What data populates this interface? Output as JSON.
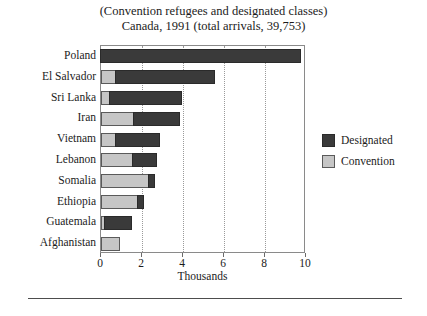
{
  "chart_data": {
    "type": "bar",
    "orientation": "horizontal",
    "stacked": true,
    "title": "(Convention refugees and designated classes)",
    "subtitle": "Canada, 1991 (total arrivals, 39,753)",
    "title_lines": [
      "(Convention refugees and designated classes)",
      "Canada, 1991 (total arrivals, 39,753)"
    ],
    "xlabel": "Thousands",
    "ylabel": "",
    "xlim": [
      0,
      10
    ],
    "ylim": null,
    "grid": "vertical-dotted",
    "legend_position": "right",
    "categories": [
      "Poland",
      "El Salvador",
      "Sri Lanka",
      "Iran",
      "Vietnam",
      "Lebanon",
      "Somalia",
      "Ethiopia",
      "Guatemala",
      "Afghanistan"
    ],
    "xticks": [
      0,
      2,
      4,
      6,
      8,
      10
    ],
    "xtick_labels": [
      "0",
      "2",
      "4",
      "6",
      "8",
      "10"
    ],
    "series": [
      {
        "name": "Convention",
        "color": "#c6c6c6",
        "values": [
          0.0,
          0.75,
          0.45,
          1.6,
          0.75,
          1.55,
          2.35,
          1.8,
          0.2,
          0.95
        ]
      },
      {
        "name": "Designated",
        "color": "#3a3a3a",
        "values": [
          9.8,
          4.85,
          3.55,
          2.3,
          2.2,
          1.25,
          0.35,
          0.35,
          1.35,
          0.0
        ]
      }
    ],
    "totals": [
      9.8,
      5.6,
      4.0,
      3.9,
      2.95,
      2.8,
      2.7,
      2.15,
      1.55,
      0.95
    ]
  },
  "legend": {
    "items": [
      {
        "label": "Designated",
        "swatch": "designated"
      },
      {
        "label": "Convention",
        "swatch": "convention"
      }
    ]
  },
  "colors": {
    "designated": "#3a3a3a",
    "convention": "#c6c6c6",
    "frame": "#8a8a8a",
    "grid": "#9a9a9a",
    "text": "#1b1b1b"
  }
}
